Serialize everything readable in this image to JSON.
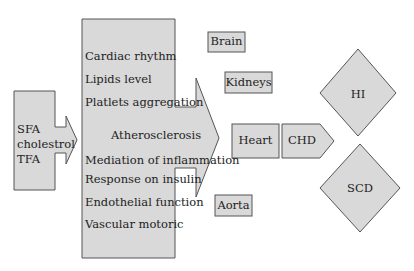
{
  "diagram": {
    "source_callout": {
      "lines": [
        "SFA",
        "cholestrol",
        "TFA"
      ]
    },
    "mechanisms_callout": {
      "items": [
        "Cardiac rhythm",
        "Lipids level",
        "Platlets aggregation",
        "Atherosclerosis",
        "Mediation of inflammation",
        "Response on insulin",
        "Endothelial function",
        "Vascular motoric"
      ]
    },
    "organs": {
      "brain": "Brain",
      "kidneys": "Kidneys",
      "heart": "Heart",
      "aorta": "Aorta"
    },
    "chd": "CHD",
    "outcomes": {
      "hi": "HI",
      "scd": "SCD"
    },
    "colors": {
      "fill": "#d9d9d9",
      "stroke": "#555555"
    }
  }
}
